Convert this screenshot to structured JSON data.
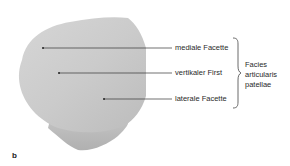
{
  "figure": {
    "panel_letter": "b",
    "labels": [
      {
        "text": "mediale Facette"
      },
      {
        "text": "vertikaler First"
      },
      {
        "text": "laterale Facette"
      }
    ],
    "group_label": [
      "Facies",
      "articularis",
      "patellae"
    ]
  }
}
